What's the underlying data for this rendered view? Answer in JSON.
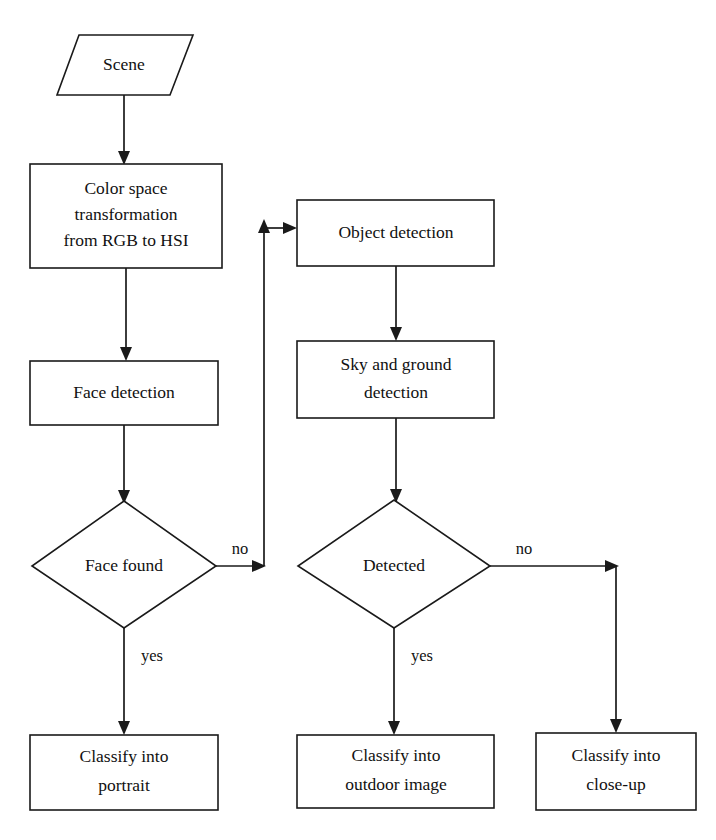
{
  "diagram": {
    "background_color": "#ffffff",
    "line_color": "#1a1a1a",
    "fill_color": "#ffffff",
    "nodes": [
      {
        "id": "scene",
        "shape": "parallelogram",
        "label": "Scene",
        "lines": [
          "Scene"
        ]
      },
      {
        "id": "color-space",
        "shape": "rectangle",
        "label": "Color space transformation from RGB to HSI",
        "lines": [
          "Color space",
          "transformation",
          "from RGB to HSI"
        ]
      },
      {
        "id": "face-detection",
        "shape": "rectangle",
        "label": "Face detection",
        "lines": [
          "Face detection"
        ]
      },
      {
        "id": "face-found",
        "shape": "diamond",
        "label": "Face found",
        "lines": [
          "Face found"
        ]
      },
      {
        "id": "classify-portrait",
        "shape": "rectangle",
        "label": "Classify into portrait",
        "lines": [
          "Classify into",
          "portrait"
        ]
      },
      {
        "id": "object-detection",
        "shape": "rectangle",
        "label": "Object detection",
        "lines": [
          "Object detection"
        ]
      },
      {
        "id": "sky-ground-detection",
        "shape": "rectangle",
        "label": "Sky and ground detection",
        "lines": [
          "Sky and ground",
          "detection"
        ]
      },
      {
        "id": "detected",
        "shape": "diamond",
        "label": "Detected",
        "lines": [
          "Detected"
        ]
      },
      {
        "id": "classify-outdoor",
        "shape": "rectangle",
        "label": "Classify into outdoor image",
        "lines": [
          "Classify into",
          "outdoor image"
        ]
      },
      {
        "id": "classify-closeup",
        "shape": "rectangle",
        "label": "Classify into close-up",
        "lines": [
          "Classify into",
          "close-up"
        ]
      }
    ],
    "edges": [
      {
        "id": "scene-to-colorspace",
        "from": "scene",
        "to": "color-space",
        "label": ""
      },
      {
        "id": "colorspace-to-facedetection",
        "from": "color-space",
        "to": "face-detection",
        "label": ""
      },
      {
        "id": "facedetection-to-facefound",
        "from": "face-detection",
        "to": "face-found",
        "label": ""
      },
      {
        "id": "facefound-no-to-objectdetection",
        "from": "face-found",
        "to": "object-detection",
        "label": "no"
      },
      {
        "id": "facefound-yes-to-portrait",
        "from": "face-found",
        "to": "classify-portrait",
        "label": "yes"
      },
      {
        "id": "objectdetection-to-skyground",
        "from": "object-detection",
        "to": "sky-ground-detection",
        "label": ""
      },
      {
        "id": "skyground-to-detected",
        "from": "sky-ground-detection",
        "to": "detected",
        "label": ""
      },
      {
        "id": "detected-yes-to-outdoor",
        "from": "detected",
        "to": "classify-outdoor",
        "label": "yes"
      },
      {
        "id": "detected-no-to-closeup",
        "from": "detected",
        "to": "classify-closeup",
        "label": "no"
      }
    ],
    "edge_labels": {
      "face_found_no": "no",
      "face_found_yes": "yes",
      "detected_no": "no",
      "detected_yes": "yes"
    }
  }
}
